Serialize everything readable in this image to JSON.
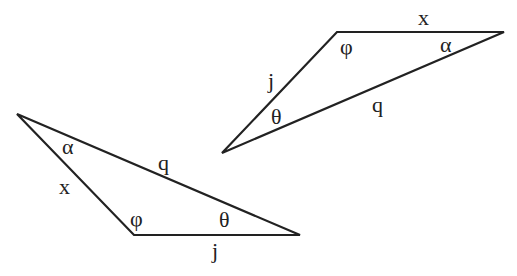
{
  "diagram": {
    "triangles": [
      {
        "id": "upper-right",
        "vertices": [
          [
            337,
            32
          ],
          [
            504,
            32
          ],
          [
            222,
            153
          ]
        ],
        "sides": {
          "top": "x",
          "left": "j",
          "long": "q"
        },
        "angles": {
          "top_left": "φ",
          "right": "α",
          "bottom_left": "θ"
        }
      },
      {
        "id": "lower-left",
        "vertices": [
          [
            17,
            114
          ],
          [
            134,
            235
          ],
          [
            300,
            235
          ]
        ],
        "sides": {
          "left": "x",
          "long": "q",
          "bottom": "j"
        },
        "angles": {
          "left": "α",
          "bottom_left": "φ",
          "bottom_right": "θ"
        }
      }
    ],
    "labels": {
      "t1_side_x": "x",
      "t1_side_j": "j",
      "t1_side_q": "q",
      "t1_angle_phi": "φ",
      "t1_angle_alpha": "α",
      "t1_angle_theta": "θ",
      "t2_side_x": "x",
      "t2_side_q": "q",
      "t2_side_j": "j",
      "t2_angle_alpha": "α",
      "t2_angle_phi": "φ",
      "t2_angle_theta": "θ"
    }
  }
}
